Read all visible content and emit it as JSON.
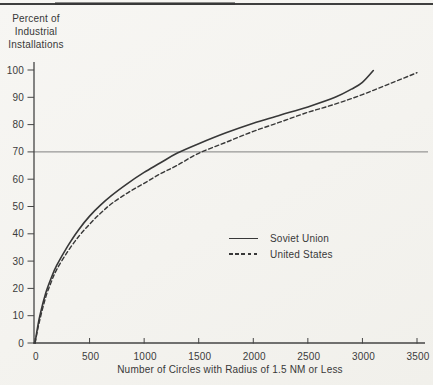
{
  "page": {
    "background": "#f4f3ef",
    "ink_color": "#3b3b3b",
    "axis_color": "#454545",
    "top_rule_color": "#3f3f3f"
  },
  "chart_data": {
    "type": "line",
    "title": "",
    "ylabel_lines": [
      "Percent of",
      "Industrial",
      "Installations"
    ],
    "xlabel": "Number of Circles with Radius of 1.5 NM or Less",
    "xlim": [
      0,
      3500
    ],
    "ylim": [
      0,
      100
    ],
    "x_ticks": [
      0,
      500,
      1000,
      1500,
      2000,
      2500,
      3000,
      3500
    ],
    "y_ticks": [
      0,
      10,
      20,
      30,
      40,
      50,
      60,
      70,
      80,
      90,
      100
    ],
    "grid": "off",
    "reference_line_y": 70,
    "legend_position": "center-right",
    "series": [
      {
        "name": "Soviet Union",
        "style": "solid",
        "color": "#383838",
        "points": [
          [
            0,
            0
          ],
          [
            25,
            6
          ],
          [
            50,
            11
          ],
          [
            100,
            18.5
          ],
          [
            150,
            24
          ],
          [
            200,
            28.5
          ],
          [
            300,
            35.5
          ],
          [
            400,
            41.5
          ],
          [
            500,
            46.5
          ],
          [
            600,
            50.5
          ],
          [
            700,
            54
          ],
          [
            850,
            58.5
          ],
          [
            1000,
            62.5
          ],
          [
            1150,
            66
          ],
          [
            1300,
            69.5
          ],
          [
            1500,
            73
          ],
          [
            1750,
            77
          ],
          [
            2000,
            80.5
          ],
          [
            2250,
            83.5
          ],
          [
            2500,
            86.5
          ],
          [
            2750,
            90
          ],
          [
            2900,
            93
          ],
          [
            3000,
            95.5
          ],
          [
            3100,
            99.8
          ]
        ]
      },
      {
        "name": "United States",
        "style": "dashed",
        "color": "#383838",
        "points": [
          [
            0,
            0
          ],
          [
            25,
            5
          ],
          [
            50,
            9.5
          ],
          [
            100,
            17
          ],
          [
            150,
            22.5
          ],
          [
            200,
            27
          ],
          [
            300,
            33.5
          ],
          [
            400,
            39
          ],
          [
            500,
            43.5
          ],
          [
            600,
            47.5
          ],
          [
            700,
            51
          ],
          [
            850,
            55
          ],
          [
            1000,
            58.5
          ],
          [
            1150,
            62
          ],
          [
            1300,
            65
          ],
          [
            1500,
            69.5
          ],
          [
            1750,
            73.5
          ],
          [
            2000,
            77.5
          ],
          [
            2250,
            81
          ],
          [
            2500,
            84.5
          ],
          [
            2750,
            87.5
          ],
          [
            3000,
            91
          ],
          [
            3250,
            95
          ],
          [
            3500,
            99
          ]
        ]
      }
    ]
  }
}
